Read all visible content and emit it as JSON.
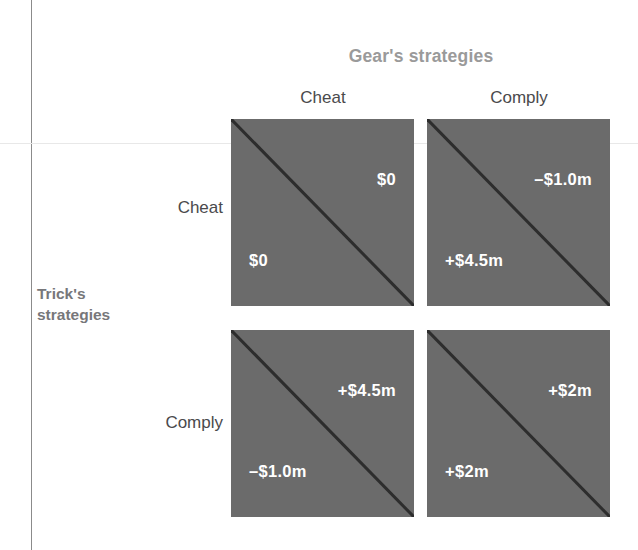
{
  "diagram": {
    "column_player": {
      "group_title": "Gear's strategies",
      "strategies": [
        "Cheat",
        "Comply"
      ]
    },
    "row_player": {
      "group_title_line1": "Trick's",
      "group_title_line2": "strategies",
      "strategies": [
        "Cheat",
        "Comply"
      ]
    },
    "colors": {
      "cell_fill": "#6b6b6b",
      "diagonal": "#2d2d2d",
      "payoff_text": "#ffffff",
      "group_title_column": "#9a9a9a",
      "group_title_row": "#77777a",
      "strategy_label": "#4a4a4c"
    },
    "cells": [
      {
        "row_strategy": "Cheat",
        "col_strategy": "Cheat",
        "upper_right_payoff": "$0",
        "lower_left_payoff": "$0"
      },
      {
        "row_strategy": "Cheat",
        "col_strategy": "Comply",
        "upper_right_payoff": "–$1.0m",
        "lower_left_payoff": "+$4.5m"
      },
      {
        "row_strategy": "Comply",
        "col_strategy": "Cheat",
        "upper_right_payoff": "+$4.5m",
        "lower_left_payoff": "–$1.0m"
      },
      {
        "row_strategy": "Comply",
        "col_strategy": "Comply",
        "upper_right_payoff": "+$2m",
        "lower_left_payoff": "+$2m"
      }
    ]
  }
}
